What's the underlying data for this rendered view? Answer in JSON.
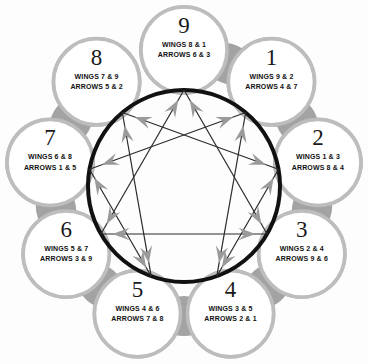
{
  "diagram": {
    "type": "enneagram",
    "geometry": {
      "center_x": 184,
      "center_y": 186,
      "inner_circle_radius": 96,
      "node_ring_radius": 136,
      "node_radius": 43
    },
    "colors": {
      "inner_circle_stroke": "#111111",
      "line_stroke": "#2b2b2b",
      "arrow_fill": "#9a9a9a",
      "node_fill": "#ffffff",
      "node_ring": "#bdbdbd",
      "petal_fill": "#a8a8a8",
      "text": "#111111",
      "background": "#fdfdfd"
    },
    "triangle_points": [
      9,
      3,
      6
    ],
    "hexad_sequence": [
      1,
      4,
      2,
      8,
      5,
      7
    ]
  },
  "nodes": [
    {
      "number": "9",
      "wings": "WINGS 8 & 1",
      "arrows": "ARROWS 6 & 3",
      "angle_deg": -90,
      "name": "node-9"
    },
    {
      "number": "1",
      "wings": "WINGS 9 & 2",
      "arrows": "ARROWS 4 & 7",
      "angle_deg": -50,
      "name": "node-1"
    },
    {
      "number": "2",
      "wings": "WINGS 1 & 3",
      "arrows": "ARROWS 8 & 4",
      "angle_deg": -10,
      "name": "node-2"
    },
    {
      "number": "3",
      "wings": "WINGS 2 & 4",
      "arrows": "ARROWS 9 & 6",
      "angle_deg": 30,
      "name": "node-3"
    },
    {
      "number": "4",
      "wings": "WINGS 3 & 5",
      "arrows": "ARROWS 2 & 1",
      "angle_deg": 70,
      "name": "node-4"
    },
    {
      "number": "5",
      "wings": "WINGS 4 & 6",
      "arrows": "ARROWS 7 & 8",
      "angle_deg": 110,
      "name": "node-5"
    },
    {
      "number": "6",
      "wings": "WINGS 5 & 7",
      "arrows": "ARROWS 3 & 9",
      "angle_deg": 150,
      "name": "node-6"
    },
    {
      "number": "7",
      "wings": "WINGS 6 & 8",
      "arrows": "ARROWS 1 & 5",
      "angle_deg": 190,
      "name": "node-7"
    },
    {
      "number": "8",
      "wings": "WINGS 7 & 9",
      "arrows": "ARROWS 5 & 2",
      "angle_deg": 230,
      "name": "node-8"
    }
  ]
}
